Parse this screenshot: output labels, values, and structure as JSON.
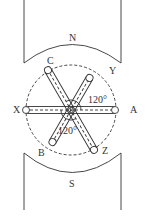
{
  "diagram": {
    "title": "",
    "poles": {
      "north": {
        "label": "N"
      },
      "south": {
        "label": "S"
      }
    },
    "coil_labels": {
      "a": "A",
      "b": "B",
      "c": "C",
      "x": "X",
      "y": "Y",
      "z": "Z"
    },
    "angles": {
      "upper": "120°",
      "lower": "120°"
    },
    "colors": {
      "stroke": "#333333",
      "background": "#ffffff"
    }
  }
}
